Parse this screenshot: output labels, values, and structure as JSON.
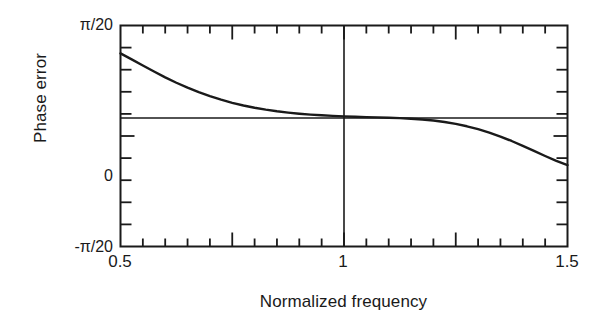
{
  "chart_data": {
    "type": "line",
    "title": "",
    "xlabel": "Normalized frequency",
    "ylabel": "Phase error",
    "xlim": [
      0.5,
      1.5
    ],
    "ylim": [
      -0.15707963,
      0.15707963
    ],
    "ylim_labels": [
      "-π/20",
      "π/20"
    ],
    "grid": false,
    "legend": null,
    "x_tick_labels": [
      {
        "value": 0.5,
        "label": "0.5"
      },
      {
        "value": 1.0,
        "label": "1"
      },
      {
        "value": 1.5,
        "label": "1.5"
      }
    ],
    "y_tick_labels": [
      {
        "value": 0.15707963,
        "label": "π/20"
      },
      {
        "value": 0.0,
        "label": "0"
      },
      {
        "value": -0.15707963,
        "label": "-π/20"
      }
    ],
    "x_minor_ticks": [
      0.55,
      0.6,
      0.65,
      0.7,
      0.75,
      0.8,
      0.85,
      0.9,
      0.95,
      1.0,
      1.05,
      1.1,
      1.15,
      1.2,
      1.25,
      1.3,
      1.35,
      1.4,
      1.45
    ],
    "x_major_ticks": [
      0.75,
      1.0,
      1.25
    ],
    "y_minor_ticks": [
      0.12566,
      0.09425,
      0.06283,
      0.03142,
      0.0,
      -0.03142,
      -0.06283,
      -0.09425,
      -0.12566
    ],
    "annotations": [
      {
        "name": "reference-level-line",
        "type": "hline",
        "y": 0.0255,
        "note": "horizontal reference line near asymptotic phase error"
      },
      {
        "name": "unity-frequency-line",
        "type": "vline",
        "x": 1.0,
        "note": "vertical line at normalized frequency 1"
      }
    ],
    "series": [
      {
        "name": "phase error",
        "x": [
          0.5,
          0.525,
          0.55,
          0.575,
          0.6,
          0.625,
          0.65,
          0.675,
          0.7,
          0.725,
          0.75,
          0.775,
          0.8,
          0.825,
          0.85,
          0.875,
          0.9,
          0.925,
          0.95,
          0.975,
          1.0,
          1.025,
          1.05,
          1.075,
          1.1,
          1.125,
          1.15,
          1.175,
          1.2,
          1.225,
          1.25,
          1.275,
          1.3,
          1.325,
          1.35,
          1.375,
          1.4,
          1.425,
          1.45,
          1.475,
          1.5
        ],
        "y": [
          0.1174,
          0.109,
          0.1002,
          0.0917,
          0.0834,
          0.0757,
          0.0687,
          0.0623,
          0.0566,
          0.0516,
          0.0472,
          0.0434,
          0.0402,
          0.0375,
          0.0352,
          0.0333,
          0.0317,
          0.0304,
          0.0294,
          0.0286,
          0.0279,
          0.0274,
          0.0269,
          0.0265,
          0.026,
          0.0254,
          0.0246,
          0.0235,
          0.022,
          0.0199,
          0.0172,
          0.0138,
          0.0097,
          0.0048,
          -0.0008,
          -0.0071,
          -0.0139,
          -0.0211,
          -0.0284,
          -0.0353,
          -0.0413
        ]
      }
    ]
  },
  "axes": {
    "frame_color": "#1a1a1a",
    "curve_color": "#1a1a1a",
    "background": "#ffffff"
  }
}
